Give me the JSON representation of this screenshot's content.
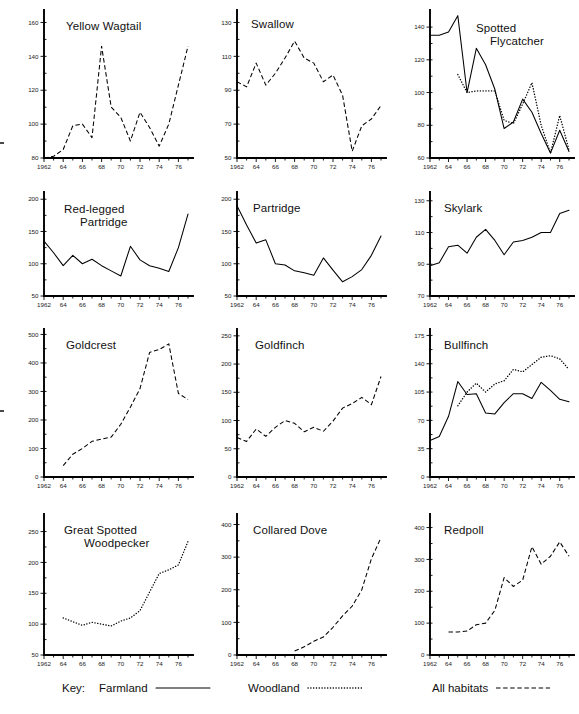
{
  "figure": {
    "x_ticks": [
      "1962",
      "64",
      "66",
      "68",
      "70",
      "72",
      "74",
      "76"
    ],
    "x_tick_years": [
      1962,
      1964,
      1966,
      1968,
      1970,
      1972,
      1974,
      1976
    ],
    "x_range": [
      1962,
      1977
    ]
  },
  "legend": {
    "key_label": "Key:",
    "items": [
      {
        "label": "Farmland",
        "style": "solid",
        "name": "farmland"
      },
      {
        "label": "Woodland",
        "style": "dotted",
        "name": "woodland"
      },
      {
        "label": "All habitats",
        "style": "dashed",
        "name": "all-habitats"
      }
    ]
  },
  "chart_data": [
    {
      "type": "line",
      "title": "Yellow Wagtail",
      "xlabel": "",
      "ylabel": "",
      "ylim": [
        80,
        165
      ],
      "y_ticks": [
        80,
        100,
        120,
        140,
        160
      ],
      "grid": false,
      "x": [
        1962,
        1963,
        1964,
        1965,
        1966,
        1967,
        1968,
        1969,
        1970,
        1971,
        1972,
        1973,
        1974,
        1975,
        1976,
        1977
      ],
      "series": [
        {
          "name": "All habitats",
          "style": "dashed",
          "values": [
            80,
            81,
            85,
            99,
            100,
            92,
            146,
            110,
            104,
            90,
            107,
            98,
            87,
            100,
            123,
            146
          ]
        }
      ]
    },
    {
      "type": "line",
      "title": "Swallow",
      "xlabel": "",
      "ylabel": "",
      "ylim": [
        50,
        135
      ],
      "y_ticks": [
        50,
        70,
        90,
        110,
        130
      ],
      "grid": false,
      "x": [
        1962,
        1963,
        1964,
        1965,
        1966,
        1967,
        1968,
        1969,
        1970,
        1971,
        1972,
        1973,
        1974,
        1975,
        1976,
        1977
      ],
      "series": [
        {
          "name": "All habitats",
          "style": "dashed",
          "values": [
            95,
            92,
            106,
            93,
            100,
            109,
            119,
            109,
            106,
            95,
            99,
            87,
            54,
            69,
            73,
            81
          ]
        }
      ]
    },
    {
      "type": "line",
      "title": "Spotted Flycatcher",
      "xlabel": "",
      "ylabel": "",
      "ylim": [
        60,
        148
      ],
      "y_ticks": [
        60,
        80,
        100,
        120,
        140
      ],
      "grid": false,
      "x": [
        1962,
        1963,
        1964,
        1965,
        1966,
        1967,
        1968,
        1969,
        1970,
        1971,
        1972,
        1973,
        1974,
        1975,
        1976,
        1977
      ],
      "series": [
        {
          "name": "Farmland",
          "style": "solid",
          "values": [
            135,
            135,
            137,
            147,
            100,
            127,
            117,
            102,
            78,
            82,
            96,
            88,
            75,
            63,
            77,
            64
          ]
        },
        {
          "name": "Woodland",
          "style": "dotted",
          "values": [
            null,
            null,
            null,
            111,
            100,
            101,
            101,
            101,
            83,
            81,
            93,
            106,
            80,
            63,
            86,
            65
          ]
        }
      ]
    },
    {
      "type": "line",
      "title": "Red-legged Partridge",
      "xlabel": "",
      "ylabel": "",
      "ylim": [
        50,
        205
      ],
      "y_ticks": [
        50,
        100,
        150,
        200
      ],
      "grid": false,
      "x": [
        1962,
        1963,
        1964,
        1965,
        1966,
        1967,
        1968,
        1969,
        1970,
        1971,
        1972,
        1973,
        1974,
        1975,
        1976,
        1977
      ],
      "series": [
        {
          "name": "Farmland",
          "style": "solid",
          "values": [
            135,
            117,
            97,
            113,
            100,
            107,
            97,
            89,
            81,
            127,
            106,
            97,
            93,
            88,
            125,
            177
          ]
        }
      ]
    },
    {
      "type": "line",
      "title": "Partridge",
      "xlabel": "",
      "ylabel": "",
      "ylim": [
        50,
        205
      ],
      "y_ticks": [
        50,
        100,
        150,
        200
      ],
      "grid": false,
      "x": [
        1962,
        1963,
        1964,
        1965,
        1966,
        1967,
        1968,
        1969,
        1970,
        1971,
        1972,
        1973,
        1974,
        1975,
        1976,
        1977
      ],
      "series": [
        {
          "name": "Farmland",
          "style": "solid",
          "values": [
            190,
            160,
            132,
            137,
            100,
            98,
            89,
            86,
            82,
            109,
            90,
            72,
            80,
            91,
            113,
            143
          ]
        }
      ]
    },
    {
      "type": "line",
      "title": "Skylark",
      "xlabel": "",
      "ylabel": "",
      "ylim": [
        70,
        133
      ],
      "y_ticks": [
        70,
        90,
        110,
        130
      ],
      "grid": false,
      "x": [
        1962,
        1963,
        1964,
        1965,
        1966,
        1967,
        1968,
        1969,
        1970,
        1971,
        1972,
        1973,
        1974,
        1975,
        1976,
        1977
      ],
      "series": [
        {
          "name": "Farmland",
          "style": "solid",
          "values": [
            89,
            91,
            101,
            102,
            97,
            107,
            112,
            105,
            96,
            104,
            105,
            107,
            110,
            110,
            122,
            124
          ]
        }
      ]
    },
    {
      "type": "line",
      "title": "Goldcrest",
      "xlabel": "",
      "ylabel": "",
      "ylim": [
        0,
        505
      ],
      "y_ticks": [
        0,
        100,
        200,
        300,
        400,
        500
      ],
      "grid": false,
      "x": [
        1962,
        1963,
        1964,
        1965,
        1966,
        1967,
        1968,
        1969,
        1970,
        1971,
        1972,
        1973,
        1974,
        1975,
        1976,
        1977
      ],
      "series": [
        {
          "name": "All habitats",
          "style": "dashed",
          "values": [
            null,
            null,
            40,
            80,
            100,
            125,
            133,
            140,
            185,
            245,
            310,
            437,
            447,
            467,
            293,
            272
          ]
        }
      ]
    },
    {
      "type": "line",
      "title": "Goldfinch",
      "xlabel": "",
      "ylabel": "",
      "ylim": [
        0,
        255
      ],
      "y_ticks": [
        0,
        50,
        100,
        150,
        200,
        250
      ],
      "grid": false,
      "x": [
        1962,
        1963,
        1964,
        1965,
        1966,
        1967,
        1968,
        1969,
        1970,
        1971,
        1972,
        1973,
        1974,
        1975,
        1976,
        1977
      ],
      "series": [
        {
          "name": "All habitats",
          "style": "dashed",
          "values": [
            70,
            63,
            85,
            72,
            88,
            100,
            95,
            80,
            88,
            81,
            99,
            122,
            130,
            141,
            128,
            178
          ]
        }
      ]
    },
    {
      "type": "line",
      "title": "Bullfinch",
      "xlabel": "",
      "ylabel": "",
      "ylim": [
        0,
        178
      ],
      "y_ticks": [
        0,
        35,
        70,
        105,
        140,
        175
      ],
      "grid": false,
      "x": [
        1962,
        1963,
        1964,
        1965,
        1966,
        1967,
        1968,
        1969,
        1970,
        1971,
        1972,
        1973,
        1974,
        1975,
        1976,
        1977
      ],
      "series": [
        {
          "name": "Farmland",
          "style": "solid",
          "values": [
            45,
            50,
            75,
            118,
            102,
            103,
            79,
            78,
            92,
            103,
            103,
            97,
            117,
            107,
            96,
            93
          ]
        },
        {
          "name": "Woodland",
          "style": "dotted",
          "values": [
            null,
            null,
            null,
            88,
            105,
            116,
            105,
            115,
            119,
            133,
            130,
            139,
            148,
            150,
            146,
            133
          ]
        }
      ]
    },
    {
      "type": "line",
      "title": "Great Spotted Woodpecker",
      "xlabel": "",
      "ylabel": "",
      "ylim": [
        50,
        272
      ],
      "y_ticks": [
        50,
        100,
        150,
        200,
        250
      ],
      "grid": false,
      "x": [
        1962,
        1963,
        1964,
        1965,
        1966,
        1967,
        1968,
        1969,
        1970,
        1971,
        1972,
        1973,
        1974,
        1975,
        1976,
        1977
      ],
      "series": [
        {
          "name": "Woodland",
          "style": "dotted",
          "values": [
            null,
            null,
            110,
            104,
            98,
            103,
            100,
            97,
            105,
            110,
            122,
            152,
            182,
            188,
            196,
            234
          ]
        }
      ]
    },
    {
      "type": "line",
      "title": "Collared Dove",
      "xlabel": "",
      "ylabel": "",
      "ylim": [
        0,
        420
      ],
      "y_ticks": [
        0,
        100,
        200,
        300,
        400
      ],
      "grid": false,
      "x": [
        1962,
        1963,
        1964,
        1965,
        1966,
        1967,
        1968,
        1969,
        1970,
        1971,
        1972,
        1973,
        1974,
        1975,
        1976,
        1977
      ],
      "series": [
        {
          "name": "All habitats",
          "style": "dashed",
          "values": [
            null,
            null,
            null,
            null,
            null,
            null,
            12,
            25,
            42,
            55,
            85,
            120,
            150,
            200,
            295,
            360
          ]
        }
      ]
    },
    {
      "type": "line",
      "title": "Redpoll",
      "xlabel": "",
      "ylabel": "",
      "ylim": [
        0,
        430
      ],
      "y_ticks": [
        0,
        100,
        200,
        300,
        400
      ],
      "grid": false,
      "x": [
        1962,
        1963,
        1964,
        1965,
        1966,
        1967,
        1968,
        1969,
        1970,
        1971,
        1972,
        1973,
        1974,
        1975,
        1976,
        1977
      ],
      "series": [
        {
          "name": "All habitats",
          "style": "dashed",
          "values": [
            null,
            null,
            72,
            72,
            75,
            95,
            100,
            140,
            243,
            215,
            235,
            340,
            285,
            310,
            355,
            310,
            412
          ]
        }
      ]
    }
  ]
}
